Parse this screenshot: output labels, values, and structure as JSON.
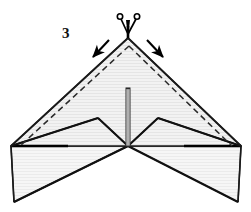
{
  "figure": {
    "kind": "origami-fold-diagram",
    "step_number": "3",
    "caption": "",
    "background_color": "#ffffff"
  },
  "palette": {
    "paper_fill": "#f0f0f0",
    "paper_fill_light": "#f6f6f6",
    "hatch_line": "#dedede",
    "outline": "#1a1a1a",
    "heavy_outline": "#000000",
    "fold_dash": "#2a2a2a",
    "arrow": "#000000",
    "scissors": "#000000",
    "label_text": "#111111"
  },
  "annotations": {
    "step_label": {
      "name": "step-number-label",
      "text": "3",
      "x": 62,
      "y": 26
    },
    "icons": [
      {
        "name": "scissors-icon",
        "meaning": "cut-along-line",
        "x": 128,
        "y": 18
      }
    ],
    "arrows": [
      {
        "name": "fold-arrow-left",
        "meaning": "fold-leading-edge-down",
        "from": [
          108,
          41
        ],
        "to": [
          92,
          58
        ],
        "direction": "down-left"
      },
      {
        "name": "fold-arrow-right",
        "meaning": "fold-leading-edge-down",
        "from": [
          148,
          41
        ],
        "to": [
          164,
          58
        ],
        "direction": "down-right"
      }
    ],
    "fold_lines": [
      {
        "name": "fold-line-left",
        "style": "dashed",
        "from": [
          129,
          46
        ],
        "to": [
          20,
          146
        ]
      },
      {
        "name": "fold-line-right",
        "style": "dashed",
        "from": [
          129,
          46
        ],
        "to": [
          232,
          146
        ]
      }
    ]
  },
  "geometry": {
    "apex": [
      128,
      38
    ],
    "center_bottom": [
      128,
      146
    ],
    "left_wing_tip": [
      11,
      146
    ],
    "right_wing_tip": [
      241,
      146
    ],
    "left_inner_peak": [
      98,
      118
    ],
    "right_inner_peak": [
      158,
      118
    ],
    "left_bottom_tip": [
      14,
      202
    ],
    "right_bottom_tip": [
      238,
      202
    ],
    "keel": {
      "name": "center-fin-keel",
      "top": [
        128,
        88
      ],
      "bottom": [
        128,
        146
      ],
      "width": 4
    }
  },
  "shapes": [
    {
      "name": "main-delta-wing-body",
      "points": "128,38 241,146 128,146 11,146",
      "fill": "paper_fill",
      "stroke": "outline"
    },
    {
      "name": "left-winglet-panel",
      "points": "11,146 98,118 128,146 14,202",
      "fill": "paper_fill",
      "stroke": "outline"
    },
    {
      "name": "right-winglet-panel",
      "points": "241,146 158,118 128,146 238,202",
      "fill": "paper_fill",
      "stroke": "outline"
    },
    {
      "name": "left-winglet-upper-strip",
      "points": "11,146 14,202 128,146",
      "fill": "paper_fill_light",
      "stroke": "outline"
    },
    {
      "name": "right-winglet-upper-strip",
      "points": "241,146 238,202 128,146",
      "fill": "paper_fill_light",
      "stroke": "outline"
    }
  ]
}
